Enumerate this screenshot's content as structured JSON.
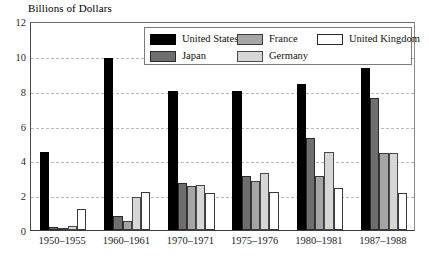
{
  "chart_data": {
    "type": "bar",
    "title": "",
    "ylabel": "Billions of Dollars",
    "xlabel": "",
    "ylim": [
      0,
      12
    ],
    "yticks": [
      0,
      2,
      4,
      6,
      8,
      10,
      12
    ],
    "grid": true,
    "legend_position": "top-center",
    "categories": [
      "1950–1955",
      "1960–1961",
      "1970–1971",
      "1975–1976",
      "1980–1981",
      "1987–1988"
    ],
    "series": [
      {
        "name": "United States",
        "color": "#000000",
        "values": [
          4.5,
          9.9,
          8.0,
          8.0,
          8.4,
          9.3
        ]
      },
      {
        "name": "Japan",
        "color": "#6e6e6e",
        "values": [
          0.15,
          0.8,
          2.7,
          3.1,
          5.3,
          7.6
        ]
      },
      {
        "name": "France",
        "color": "#a5a5a5",
        "values": [
          0.05,
          0.5,
          2.5,
          2.8,
          3.1,
          4.4
        ]
      },
      {
        "name": "Germany",
        "color": "#d6d6d6",
        "values": [
          0.25,
          1.9,
          2.6,
          3.3,
          4.5,
          4.4
        ]
      },
      {
        "name": "United Kingdom",
        "color": "#ffffff",
        "values": [
          1.2,
          2.2,
          2.1,
          2.2,
          2.4,
          2.1
        ]
      }
    ]
  },
  "legend": {
    "columns": [
      [
        "United States",
        "Japan"
      ],
      [
        "France",
        "Germany"
      ],
      [
        "United Kingdom"
      ]
    ]
  }
}
